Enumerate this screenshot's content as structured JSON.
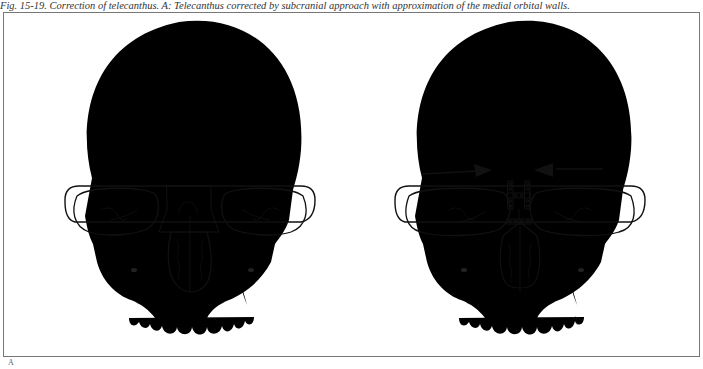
{
  "figure": {
    "caption": "Fig. 15-19. Correction of telecanthus. A: Telecanthus corrected by subcranial approach with approximation of the medial orbital walls.",
    "panel_label": "A",
    "panels": [
      {
        "name": "before",
        "description": "Frontal skull view with hatched region marking the widened medial orbital / nasal bridge area (telecanthus)",
        "markings": [
          "horizontal-hatching-resection-area"
        ]
      },
      {
        "name": "after",
        "description": "Frontal skull view after correction; medial orbital walls approximated, fixed with H-shaped and straight bone plates",
        "markings": [
          "arrow-right-inward",
          "arrow-left-inward",
          "h-plate",
          "straight-plate"
        ],
        "artist_signature": "signature-mark"
      }
    ],
    "colors": {
      "line": "#111111",
      "frame": "#777777",
      "caption": "#333333",
      "background": "#ffffff"
    }
  }
}
